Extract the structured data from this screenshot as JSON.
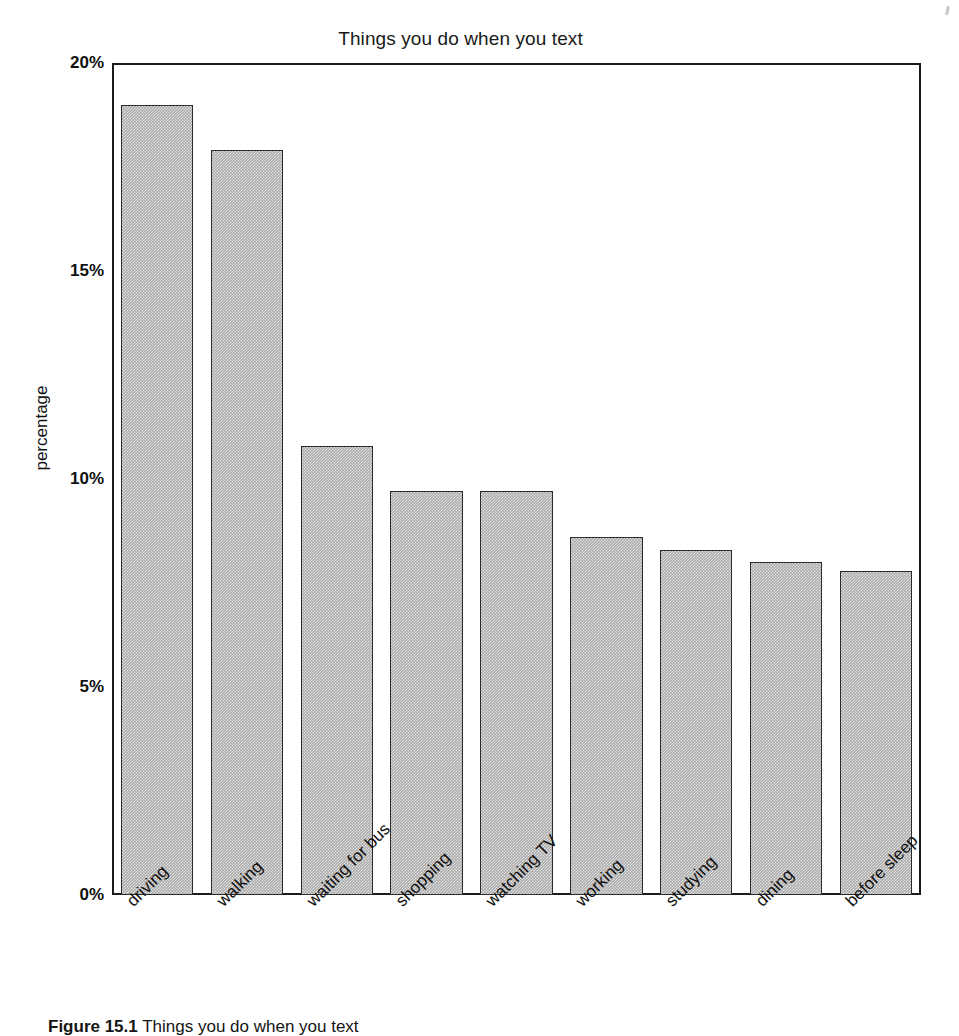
{
  "figure": {
    "caption_number": "Figure 15.1",
    "caption_text": "Things you do when you text"
  },
  "chart_data": {
    "type": "bar",
    "title": "Things you do when you text",
    "xlabel": "",
    "ylabel": "percentage",
    "categories": [
      "driving",
      "walking",
      "waiting for bus",
      "shopping",
      "watching TV",
      "working",
      "studying",
      "dining",
      "before sleep"
    ],
    "values": [
      19.0,
      17.9,
      10.8,
      9.7,
      9.7,
      8.6,
      8.3,
      8.0,
      7.8
    ],
    "value_labels": [
      "19%",
      "17.9%",
      "10.8%",
      "9.7%",
      "9.7%",
      "8.6%",
      "8.3%",
      "8.0%",
      "7.8%"
    ],
    "ylim": [
      0,
      20
    ],
    "yticks": [
      0,
      5,
      10,
      15,
      20
    ],
    "ytick_labels": [
      "0%",
      "5%",
      "10%",
      "15%",
      "20%"
    ],
    "grid": false,
    "legend": null,
    "bar_fill_color": "#ababab",
    "bar_edge_color": "#2b2b2b",
    "frame_color": "#1c1c1c",
    "background_color": "#ffffff"
  }
}
